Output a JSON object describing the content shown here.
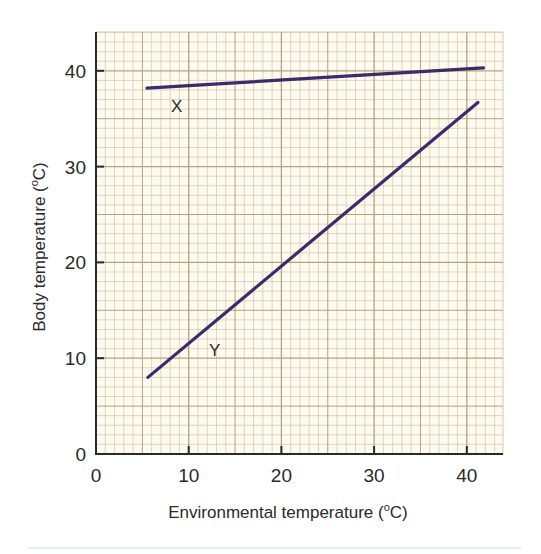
{
  "chart_data": {
    "type": "line",
    "title": "",
    "xlabel": "Environmental temperature (oC)",
    "ylabel": "Body temperature (oC)",
    "xlim": [
      0,
      44
    ],
    "ylim": [
      0,
      44
    ],
    "x_ticks": [
      0,
      10,
      20,
      30,
      40
    ],
    "y_ticks": [
      0,
      10,
      20,
      30,
      40
    ],
    "grid": true,
    "grid_style": "graph paper, 1-unit minor squares, 10-unit major lines",
    "legend": "none (lines labelled inline)",
    "series": [
      {
        "name": "X",
        "x": [
          5.5,
          41.8
        ],
        "y": [
          38.2,
          40.3
        ],
        "color": "#3d2a6b"
      },
      {
        "name": "Y",
        "x": [
          5.6,
          41.2
        ],
        "y": [
          8.0,
          36.7
        ],
        "color": "#3d2a6b"
      }
    ],
    "annotations": [
      {
        "text": "X",
        "x": 8.7,
        "y": 36.4
      },
      {
        "text": "Y",
        "x": 12.8,
        "y": 11.0
      }
    ]
  },
  "labels": {
    "xlabel_main": "Environmental temperature (",
    "xlabel_sup": "o",
    "xlabel_end": "C)",
    "ylabel_main": "Body temperature (",
    "ylabel_sup": "o",
    "ylabel_end": "C)"
  },
  "colors": {
    "paper": "#fdfaf0",
    "minor_grid": "#d9ccae",
    "major_grid": "#b7a27a",
    "axis": "#2a2a2a",
    "line": "#3d2a6b"
  }
}
